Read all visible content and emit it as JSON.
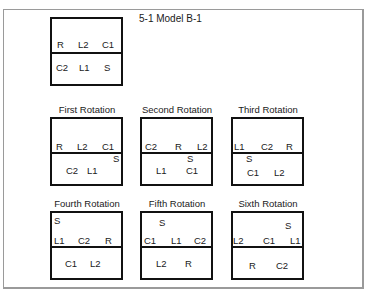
{
  "title": "5-1 Model B-1",
  "base": {
    "label": "",
    "positions": [
      {
        "id": "R",
        "x": 7,
        "y": 23
      },
      {
        "id": "L2",
        "x": 28,
        "y": 23
      },
      {
        "id": "C1",
        "x": 52,
        "y": 23
      },
      {
        "id": "C2",
        "x": 6,
        "y": 46
      },
      {
        "id": "L1",
        "x": 29,
        "y": 46
      },
      {
        "id": "S",
        "x": 54,
        "y": 46
      }
    ]
  },
  "rotations": [
    {
      "label": "First Rotation",
      "positions": [
        {
          "id": "R",
          "x": 6,
          "y": 25
        },
        {
          "id": "L2",
          "x": 27,
          "y": 25
        },
        {
          "id": "C1",
          "x": 52,
          "y": 25
        },
        {
          "id": "S",
          "x": 63,
          "y": 37
        },
        {
          "id": "C2",
          "x": 16,
          "y": 49
        },
        {
          "id": "L1",
          "x": 37,
          "y": 49
        }
      ]
    },
    {
      "label": "Second Rotation",
      "positions": [
        {
          "id": "C2",
          "x": 5,
          "y": 25
        },
        {
          "id": "R",
          "x": 35,
          "y": 25
        },
        {
          "id": "L2",
          "x": 57,
          "y": 25
        },
        {
          "id": "S",
          "x": 47,
          "y": 37
        },
        {
          "id": "L1",
          "x": 16,
          "y": 49
        },
        {
          "id": "C1",
          "x": 46,
          "y": 49
        }
      ]
    },
    {
      "label": "Third Rotation",
      "positions": [
        {
          "id": "L1",
          "x": 3,
          "y": 25
        },
        {
          "id": "C2",
          "x": 30,
          "y": 25
        },
        {
          "id": "R",
          "x": 55,
          "y": 25
        },
        {
          "id": "S",
          "x": 15,
          "y": 37
        },
        {
          "id": "C1",
          "x": 16,
          "y": 51
        },
        {
          "id": "L2",
          "x": 43,
          "y": 51
        }
      ]
    },
    {
      "label": "Fourth Rotation",
      "positions": [
        {
          "id": "S",
          "x": 4,
          "y": 5
        },
        {
          "id": "L1",
          "x": 4,
          "y": 25
        },
        {
          "id": "C2",
          "x": 28,
          "y": 25
        },
        {
          "id": "R",
          "x": 55,
          "y": 25
        },
        {
          "id": "C1",
          "x": 15,
          "y": 48
        },
        {
          "id": "L2",
          "x": 40,
          "y": 48
        }
      ]
    },
    {
      "label": "Fifth Rotation",
      "positions": [
        {
          "id": "S",
          "x": 19,
          "y": 7
        },
        {
          "id": "C1",
          "x": 4,
          "y": 25
        },
        {
          "id": "L1",
          "x": 31,
          "y": 25
        },
        {
          "id": "C2",
          "x": 54,
          "y": 25
        },
        {
          "id": "L2",
          "x": 16,
          "y": 48
        },
        {
          "id": "R",
          "x": 45,
          "y": 48
        }
      ]
    },
    {
      "label": "Sixth Rotation",
      "positions": [
        {
          "id": "S",
          "x": 54,
          "y": 10
        },
        {
          "id": "L2",
          "x": 2,
          "y": 25
        },
        {
          "id": "C1",
          "x": 32,
          "y": 25
        },
        {
          "id": "L1",
          "x": 59,
          "y": 25
        },
        {
          "id": "R",
          "x": 18,
          "y": 50
        },
        {
          "id": "C2",
          "x": 45,
          "y": 50
        }
      ]
    }
  ]
}
